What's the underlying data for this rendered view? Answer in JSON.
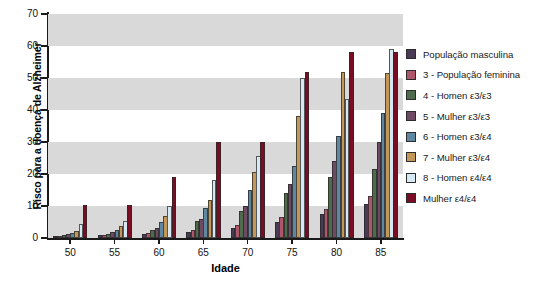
{
  "chart_data": {
    "type": "bar",
    "title": "",
    "xlabel": "Idade",
    "ylabel": "Risco para a doença de Alzheimer",
    "categories": [
      "50",
      "55",
      "60",
      "65",
      "70",
      "75",
      "80",
      "85"
    ],
    "ylim": [
      0,
      70
    ],
    "ytick_values": [
      0,
      10,
      20,
      30,
      40,
      50,
      60,
      70
    ],
    "grid": "alternating horizontal gray bands every 20 units",
    "legend_position": "right",
    "series": [
      {
        "name": "População masculina",
        "color": "#4a3a55",
        "values": [
          0.6,
          0.8,
          1.2,
          2.0,
          3.2,
          5.0,
          7.5,
          10.5
        ]
      },
      {
        "name": "3 - População feminina",
        "color": "#b0566a",
        "values": [
          0.7,
          1.0,
          1.6,
          2.6,
          4.2,
          6.5,
          9.0,
          13.0
        ]
      },
      {
        "name": "4 - Homen ε3/ε3",
        "color": "#4e6b4e",
        "values": [
          1.0,
          1.4,
          2.6,
          5.2,
          8.5,
          14.0,
          19.0,
          21.5
        ]
      },
      {
        "name": "5 - Mulher ε3/ε3",
        "color": "#6e4a63",
        "values": [
          1.2,
          1.8,
          3.2,
          6.0,
          10.0,
          17.0,
          24.0,
          30.0
        ]
      },
      {
        "name": "6 - Homen ε3/ε4",
        "color": "#5f87a0",
        "values": [
          1.6,
          2.6,
          5.0,
          9.5,
          15.0,
          22.5,
          32.0,
          39.0
        ]
      },
      {
        "name": "7 -  Mulher ε3/ε4",
        "color": "#c39758",
        "values": [
          2.2,
          3.6,
          7.0,
          12.0,
          20.5,
          38.0,
          52.0,
          51.5
        ]
      },
      {
        "name": "8 - Homen ε4/ε4",
        "color": "#d6e8f2",
        "values": [
          4.5,
          5.2,
          10.0,
          18.0,
          25.5,
          50.0,
          43.5,
          59.0
        ]
      },
      {
        "name": "Mulher ε4/ε4",
        "color": "#7a0c24",
        "values": [
          10.2,
          10.2,
          19.0,
          30.0,
          30.0,
          52.0,
          58.0,
          58.0
        ]
      }
    ]
  }
}
